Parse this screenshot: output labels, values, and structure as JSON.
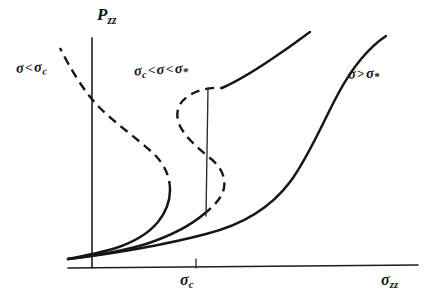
{
  "figure": {
    "kind": "hand-drawn line plot",
    "background_color": "#ffffff",
    "ink_color": "#161616"
  },
  "axes": {
    "y_label": "P",
    "y_label_sub": "zz",
    "x_label": "σ",
    "x_label_sub": "zz",
    "x_tick_label": "σ",
    "x_tick_label_sub": "c"
  },
  "annotations": {
    "subcritical": {
      "sigma": "σ",
      "relation": "<",
      "limit": "σ",
      "limit_sub": "c"
    },
    "intermediate": {
      "lower": "σ",
      "lower_sub": "c",
      "relation_left": "<",
      "sigma": "σ",
      "relation_right": "<",
      "upper": "σ",
      "upper_sub": "*"
    },
    "supercritical": {
      "sigma": "σ",
      "relation": ">",
      "limit": "σ",
      "limit_sub": "*"
    }
  },
  "chart_data": {
    "type": "line",
    "title": "",
    "xlabel": "σ_zz",
    "ylabel": "P_zz",
    "xlim": [
      0,
      428
    ],
    "ylim": [
      0,
      307
    ],
    "grid": false,
    "legend": "inline annotations",
    "axis_geometry": {
      "x_axis": {
        "x1": 68,
        "y1": 268,
        "x2": 418,
        "y2": 265
      },
      "y_axis": {
        "x1": 92,
        "y1": 38,
        "x2": 92,
        "y2": 268
      },
      "sigma_c_tick": {
        "x": 196,
        "y_top": 259,
        "y_bottom": 268
      }
    },
    "maxwell_tie_line": {
      "x_top": 208,
      "y_top": 88,
      "x_bottom": 206,
      "y_bottom": 216
    },
    "series": [
      {
        "name": "σ < σ_c",
        "style": "dashed above turning point, solid lower branch",
        "solid_path": "M 68,259 C 84,256 100,253 116,248 C 134,242 148,234 158,222 C 166,212 170,200 170,190",
        "dashed_path": "M 170,190 C 170,176 164,164 154,154 C 138,139 116,124 100,108 C 84,92 70,68 60,48"
      },
      {
        "name": "σ_c < σ < σ_*",
        "style": "S-curve, dashed unstable middle branch, solid end branches",
        "solid_lower_path": "M 68,259 C 92,256 120,252 146,244 C 170,236 190,226 204,214",
        "dashed_path": "M 204,214 C 214,206 222,198 224,188 C 226,176 220,166 210,158 C 198,148 186,138 180,126 C 174,113 178,102 190,95 C 200,89 212,87 222,88",
        "solid_upper_path": "M 222,88 C 240,80 262,66 282,52 C 294,44 304,36 310,32"
      },
      {
        "name": "σ > σ_*",
        "style": "monotonic sigmoid, fully solid",
        "solid_path": "M 68,259 C 110,254 160,246 206,234 C 246,224 272,206 290,182 C 308,158 322,124 338,94 C 352,68 368,48 386,36"
      }
    ]
  }
}
